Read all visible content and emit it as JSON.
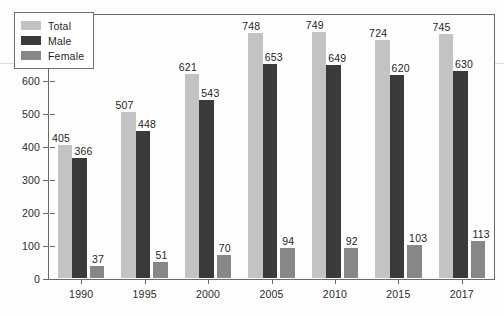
{
  "chart_data": {
    "type": "bar",
    "title": "",
    "subtitle": "",
    "xlabel": "",
    "ylabel": "",
    "categories": [
      "1990",
      "1995",
      "2000",
      "2005",
      "2010",
      "2015",
      "2017"
    ],
    "series": [
      {
        "name": "Total",
        "color": "#c3c3c3",
        "values": [
          405,
          507,
          621,
          748,
          749,
          724,
          745
        ]
      },
      {
        "name": "Male",
        "color": "#3a3a3a",
        "values": [
          366,
          448,
          543,
          653,
          649,
          620,
          630
        ]
      },
      {
        "name": "Female",
        "color": "#878787",
        "values": [
          37,
          51,
          70,
          94,
          92,
          103,
          113
        ]
      }
    ],
    "ylim": [
      0,
      800
    ],
    "ytick_values": [
      0,
      100,
      200,
      300,
      400,
      500,
      600,
      700,
      800
    ],
    "ytick_labels": [
      "0",
      "100",
      "200",
      "300",
      "400",
      "500",
      "600",
      "700",
      "800"
    ],
    "grid": false,
    "legend_position": "top-left",
    "data_labels_shown": true
  },
  "legend": {
    "entries": [
      {
        "label": "Total"
      },
      {
        "label": "Male"
      },
      {
        "label": "Female"
      }
    ]
  },
  "axes": {
    "frame_color": "#6a6a6a",
    "tick_color": "#6a6a6a",
    "label_color": "#2b2b2b"
  }
}
